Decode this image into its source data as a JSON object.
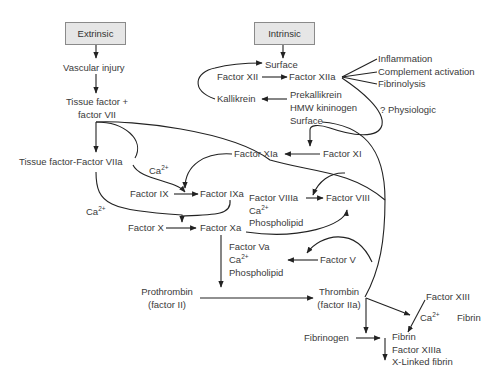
{
  "diagram": {
    "pathways": {
      "extrinsic": "Extrinsic",
      "intrinsic": "Intrinsic"
    },
    "extrinsic": {
      "vascular_injury": "Vascular injury",
      "tf_plus_line1": "Tissue factor +",
      "tf_plus_line2": "factor VII",
      "tf_viia": "Tissue factor-Factor VIIa"
    },
    "intrinsic": {
      "surface_top": "Surface",
      "factor_xii": "Factor XII",
      "factor_xiia": "Factor XIIa",
      "kallikrein": "Kallikrein",
      "prekallikrein": "Prekallikrein",
      "hmw_kininogen": "HMW kininogen",
      "surface_bottom": "Surface",
      "effects": [
        "Inflammation",
        "Complement activation",
        "Fibrinolysis"
      ],
      "physiologic": "? Physiologic",
      "factor_xi": "Factor XI",
      "factor_xia": "Factor XIa"
    },
    "common": {
      "ca_label": "Ca",
      "ca_sup": "2+",
      "factor_ix": "Factor IX",
      "factor_ixa": "Factor IXa",
      "factor_viiia": "Factor VIIIa",
      "phospholipid": "Phospholipid",
      "factor_viii": "Factor VIII",
      "factor_x": "Factor X",
      "factor_xa": "Factor Xa",
      "factor_va": "Factor Va",
      "factor_v": "Factor V",
      "prothrombin_line1": "Prothrombin",
      "prothrombin_line2": "(factor II)",
      "thrombin_line1": "Thrombin",
      "thrombin_line2": "(factor IIa)",
      "factor_xiii": "Factor XIII",
      "fibrin_side": "Fibrin",
      "fibrinogen": "Fibrinogen",
      "fibrin": "Fibrin",
      "factor_xiiia": "Factor XIIIa",
      "x_linked_fibrin": "X-Linked fibrin"
    }
  }
}
